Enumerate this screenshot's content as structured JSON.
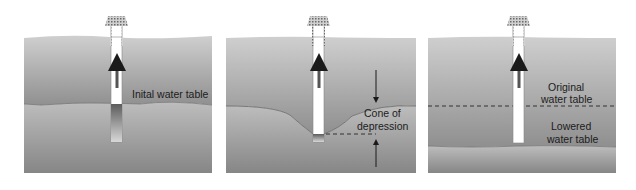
{
  "panels": [
    {
      "id": "initial",
      "labels": [
        "Inital water table"
      ]
    },
    {
      "id": "cone",
      "labels": [
        "Cone of",
        "depression"
      ]
    },
    {
      "id": "lowered",
      "labels": [
        "Original",
        "water table",
        "Lowered",
        "water table"
      ]
    }
  ],
  "colors": {
    "dry_soil_top": "#c9c9c9",
    "dry_soil_bottom": "#8e8e8e",
    "saturated_top": "#b8b8b8",
    "saturated_bottom": "#8a8a8a",
    "well": "#ffffff",
    "arrow": "#555555"
  }
}
